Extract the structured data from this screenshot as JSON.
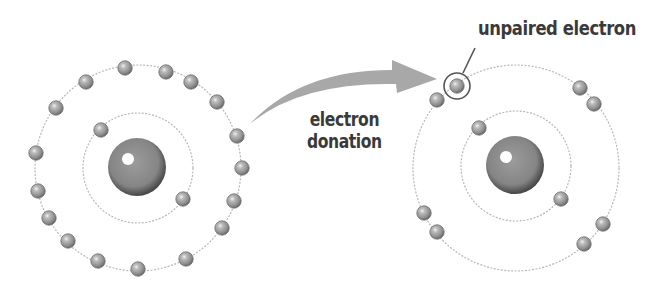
{
  "diagram": {
    "labels": {
      "arrow_line1": "electron",
      "arrow_line2": "donation",
      "unpaired": "unpaired electron"
    },
    "colors": {
      "electron_fill": "#9a9a9a",
      "electron_shadow": "#6e6e6e",
      "nucleus_fill": "#8a8a8a",
      "nucleus_rim": "#4a4a4a",
      "orbit": "#b8b8b8",
      "arrow": "#a8a8a8",
      "text": "#3a3a3a"
    },
    "atoms": [
      {
        "name": "donor-atom",
        "nucleus": {
          "cx": 137,
          "cy": 167,
          "r": 29
        },
        "orbits": [
          {
            "name": "inner-shell",
            "cx": 138,
            "cy": 168,
            "r": 55
          },
          {
            "name": "outer-shell",
            "cx": 138,
            "cy": 168,
            "r": 103
          }
        ],
        "inner_electrons": [
          [
            101,
            130
          ],
          [
            183,
            199
          ]
        ],
        "outer_electrons": [
          [
            125,
            68
          ],
          [
            166,
            72
          ],
          [
            191,
            82
          ],
          [
            217,
            102
          ],
          [
            237,
            136
          ],
          [
            242,
            168
          ],
          [
            234,
            201
          ],
          [
            222,
            228
          ],
          [
            186,
            259
          ],
          [
            138,
            269
          ],
          [
            98,
            261
          ],
          [
            68,
            241
          ],
          [
            49,
            218
          ],
          [
            38,
            191
          ],
          [
            36,
            153
          ],
          [
            56,
            108
          ],
          [
            86,
            82
          ]
        ]
      },
      {
        "name": "acceptor-atom",
        "nucleus": {
          "cx": 515,
          "cy": 165,
          "r": 29
        },
        "orbits": [
          {
            "name": "inner-shell",
            "cx": 516,
            "cy": 166,
            "r": 55
          },
          {
            "name": "outer-shell",
            "cx": 516,
            "cy": 168,
            "r": 103
          }
        ],
        "inner_electrons": [
          [
            479,
            128
          ],
          [
            561,
            199
          ]
        ],
        "outer_electrons": [
          [
            437,
            100
          ],
          [
            580,
            88
          ],
          [
            594,
            104
          ],
          [
            424,
            213
          ],
          [
            437,
            232
          ],
          [
            603,
            224
          ],
          [
            584,
            244
          ]
        ],
        "unpaired_electron": {
          "cx": 457,
          "cy": 86,
          "ring_r": 13
        }
      }
    ],
    "arrow": {
      "path": "M250 124 Q 300 70 392 70 L 392 60 L 437 79 L 397 93 L 396 84 Q 300 82 250 124 Z"
    },
    "leader_line": {
      "x1": 475,
      "y1": 48,
      "x2": 463,
      "y2": 73
    }
  }
}
